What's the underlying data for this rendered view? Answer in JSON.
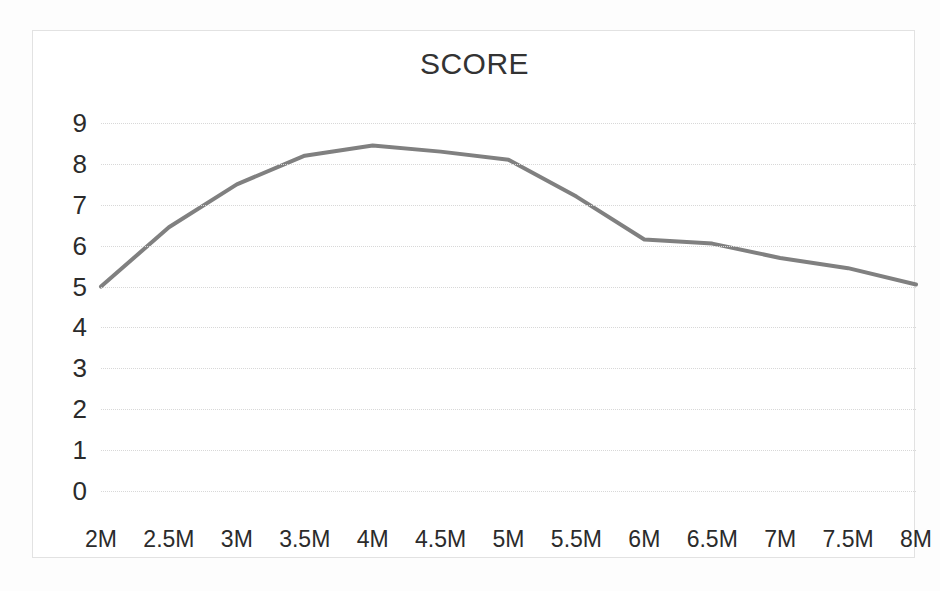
{
  "chart_data": {
    "type": "line",
    "title": "SCORE",
    "xlabel": "",
    "ylabel": "",
    "categories": [
      "2M",
      "2.5M",
      "3M",
      "3.5M",
      "4M",
      "4.5M",
      "5M",
      "5.5M",
      "6M",
      "6.5M",
      "7M",
      "7.5M",
      "8M"
    ],
    "values": [
      5.0,
      6.45,
      7.5,
      8.2,
      8.45,
      8.3,
      8.1,
      7.2,
      6.15,
      6.05,
      5.7,
      5.45,
      5.05
    ],
    "series": [
      {
        "name": "SCORE",
        "values": [
          5.0,
          6.45,
          7.5,
          8.2,
          8.45,
          8.3,
          8.1,
          7.2,
          6.15,
          6.05,
          5.7,
          5.45,
          5.05
        ],
        "color": "#808080"
      }
    ],
    "ylim": [
      0,
      9
    ],
    "yticks": [
      9,
      8,
      7,
      6,
      5,
      4,
      3,
      2,
      1,
      0
    ],
    "ytick_labels": [
      "9",
      "8",
      "7",
      "6",
      "5",
      "4",
      "3",
      "2",
      "1",
      "0"
    ],
    "grid": true,
    "grid_axis": "y",
    "grid_style": "dotted",
    "legend": false,
    "legend_position": "none",
    "markers": false,
    "line_width": 4,
    "line_color": "#808080",
    "plot_background": "#ffffff",
    "border_color": "#e2e2e2",
    "title_color": "#333333",
    "tick_color": "#2b2b2b"
  },
  "figure": {
    "caption": ""
  }
}
